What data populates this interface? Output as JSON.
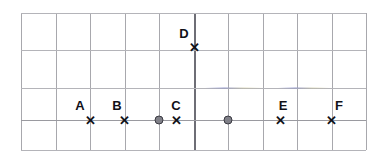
{
  "figure": {
    "width": 386,
    "height": 161,
    "background_color": "#ffffff"
  },
  "grid": {
    "columns": 10,
    "rows": 4,
    "line_color": "#a8a8ad",
    "emphasis_line_color": "#6e6e76",
    "left": 21,
    "right": 366,
    "top": 13,
    "bottom": 150,
    "column_spacing": 34.5,
    "vertical_lines_x": [
      21,
      55.5,
      90,
      124.5,
      159,
      194,
      228,
      262.5,
      297,
      331.5,
      366
    ],
    "horizontal_lines_y": [
      13,
      50,
      88,
      120,
      150
    ],
    "emphasis_vertical_x": 194,
    "axis_horizontal_y": 120
  },
  "points": [
    {
      "label": "A",
      "marker": "x-marker",
      "x": 90,
      "y": 120,
      "label_x": 80,
      "label_y": 105
    },
    {
      "label": "B",
      "marker": "x-marker",
      "x": 124.5,
      "y": 120,
      "label_x": 117,
      "label_y": 105
    },
    {
      "label": "C",
      "marker": "x-marker",
      "x": 176,
      "y": 120,
      "label_x": 176,
      "label_y": 105
    },
    {
      "label": "D",
      "marker": "x-marker",
      "x": 194,
      "y": 47,
      "label_x": 184,
      "label_y": 33
    },
    {
      "label": "E",
      "marker": "x-marker",
      "x": 280,
      "y": 120,
      "label_x": 283,
      "label_y": 105
    },
    {
      "label": "F",
      "marker": "x-marker",
      "x": 331.5,
      "y": 120,
      "label_x": 339,
      "label_y": 105
    }
  ],
  "dots": [
    {
      "name": "reference-dot-left",
      "x": 159,
      "y": 120,
      "color": "#808088"
    },
    {
      "name": "reference-dot-right",
      "x": 228,
      "y": 120,
      "color": "#808088"
    }
  ],
  "marker_glyph": "✕"
}
